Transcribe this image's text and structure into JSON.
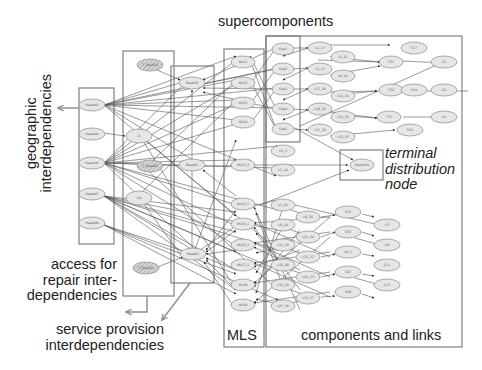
{
  "labels": {
    "supercomponents": "supercomponents",
    "geographic": "geographic interdependencies",
    "geographic_line1": "geographic",
    "geographic_line2": "interdependencies",
    "access_line1": "access for",
    "access_line2": "repair inter-",
    "access_line3": "dependencies",
    "service_line1": "service provision",
    "service_line2": "interdependencies",
    "terminal_line1": "terminal",
    "terminal_line2": "distribution",
    "terminal_line3": "node",
    "mls": "MLS",
    "components": "components and links"
  },
  "colors": {
    "box_stroke": "#808080",
    "edge": "#555555",
    "node_fill": "#e6e6e6",
    "node_stroke": "#8a8a8a",
    "hatched_fill": "#bdbdbd",
    "arrow_gray": "#8c8c8c",
    "text": "#222222"
  },
  "groups": {
    "geographic": [
      "Hazard1",
      "Hazard4",
      "Hazard6",
      "Hazard7",
      "Hazard9"
    ],
    "access_repair": [
      "T_Road18",
      "I1",
      "I16",
      "T_Road21",
      "T_Road22"
    ],
    "service_provision": [
      "Road18",
      "Road22",
      "Road21"
    ],
    "mls": [
      "MLS1",
      "MLS2",
      "MLS3",
      "MLS4",
      "MLS5_2",
      "MLS5_1",
      "MLS6_1",
      "MLS6_2",
      "MLS7_1",
      "MLS9",
      "MLS8"
    ],
    "supercomponents": [
      "Sup1",
      "Sup2",
      "Sup3",
      "Sup4",
      "Sup5"
    ],
    "terminal": [
      "Memphis"
    ]
  },
  "nodes": {
    "hazard1": "Hazard1",
    "hazard4": "Hazard4",
    "hazard6": "Hazard6",
    "hazard7": "Hazard7",
    "hazard9": "Hazard9",
    "troad18": "T_Road18",
    "i1": "I1",
    "i16": "I16",
    "troad22": "T_Road22",
    "troad21": "T_Road21",
    "road18": "Road18",
    "road22": "Road22",
    "road21": "Road21",
    "mls1": "MLS1",
    "mls2": "MLS2",
    "mls3": "MLS3",
    "mls4": "MLS4",
    "mls5_2": "MLS5_2",
    "mls5_1": "MLS5_1",
    "mls6_1": "MLS6_1",
    "mls6_2": "MLS6_2",
    "mls7_1": "MLS7_1",
    "mls9": "MLS9",
    "mls8": "MLS8",
    "sup1": "Sup1",
    "sup2": "Sup2",
    "sup3": "Sup3",
    "sup4": "Sup4",
    "sup5": "Sup5",
    "l1_17": "L1_17",
    "l3_13": "L3_13",
    "l17_18": "L17_18",
    "l18_32": "L18_32",
    "l31_32": "L31_32",
    "l2_21": "L2_21",
    "l9_36": "L9_36",
    "l16_34": "L16_34",
    "l34_36": "L34_36",
    "l32_33": "L32_33",
    "t51": "T51",
    "t52": "T52",
    "t53": "T53",
    "s17": "S17",
    "s34": "S34",
    "s36": "S36",
    "c1": "C1",
    "c2": "C2",
    "c4": "C4",
    "g1_3": "G1_3",
    "l1_10": "L1_10",
    "l1_22": "L1_22",
    "l8_14": "L8_14",
    "l11_19": "L11_19",
    "l22_28": "L22_28",
    "l32_34": "L32_34",
    "l27_36": "L27_36",
    "l8_28": "L8_28",
    "l21_34": "L21_34",
    "l23_37": "L23_37",
    "l26_33": "L26_33",
    "l33_37": "L33_37",
    "s15": "S15",
    "s33": "S33",
    "g4_1": "G4_1",
    "s27": "S27",
    "s39": "S39",
    "c3": "C3",
    "c8": "C8",
    "c11": "C11",
    "c13": "C13",
    "memphis": "Memphis"
  }
}
